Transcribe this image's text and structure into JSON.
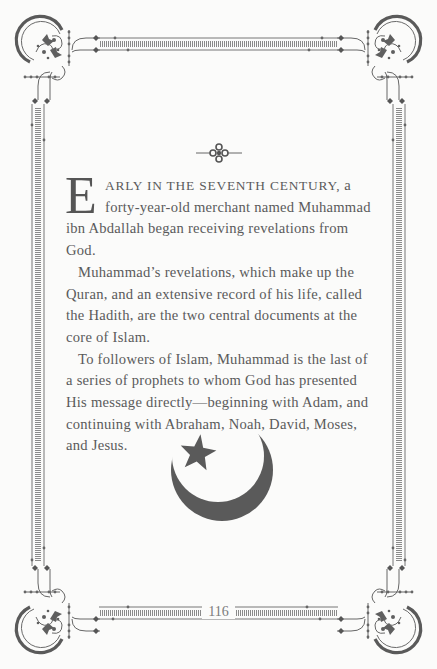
{
  "page": {
    "ornament": "fleuron-icon",
    "drop_cap": "E",
    "lead_in_smallcaps": "ARLY IN THE SEVENTH CENTURY,",
    "paragraphs": [
      " a forty-year-old merchant named Muhammad ibn Abdallah began receiving revelations from God.",
      "Muhammad’s revelations, which make up the Quran, and an extensive record of his life, called the Hadith, are the two central documents at the core of Islam.",
      "To followers of Islam, Muhammad is the last of a series of prophets to whom God has presented His message directly—beginning with Adam, and continuing with Abraham, Noah, David, Moses, and Jesus."
    ],
    "emblem": "crescent-and-star-icon",
    "page_number": "116"
  },
  "colors": {
    "background": "#fbfbfa",
    "ink": "#555555",
    "border": "#777777"
  }
}
